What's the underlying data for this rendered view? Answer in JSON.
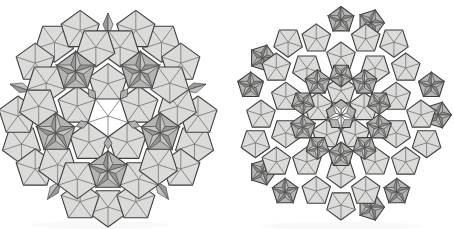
{
  "page": {
    "background": "#ffffff",
    "width": 454,
    "height": 229
  },
  "palette": {
    "pent_fill": "#dbdbd9",
    "pent_fill_alt": "#d6d6d4",
    "hole_fill": "#ffffff",
    "star_bg": "#b4b4b2",
    "star_dark": "#979795",
    "star_light": "#c6c5c3",
    "rim_star_dark": "#8d8d8b",
    "rim_star_light": "#b9b8b6",
    "white_star_dark": "#f0f0ee",
    "white_star_light": "#ffffff",
    "rhomb_fill": "#b0b0ae",
    "wedge_dark": "#9a9a98",
    "wedge_light": "#c2c1bf",
    "outline_stroke": "#3d3d3d",
    "fan_stroke": "#6b6b6b",
    "facet_stroke": "#4a4a4a",
    "outline_w": 1.1,
    "fan_w": 0.75,
    "facet_w": 0.7,
    "shadow_opacity": 0.05
  },
  "figures": [
    {
      "name": "left-patch-pentagon-hole",
      "cx": 108,
      "cy": 116,
      "pentR": 20,
      "shadow": {
        "cx": 100,
        "cy": 225,
        "rx": 70,
        "ry": 4
      },
      "pent_rings": [
        {
          "id": "caps",
          "r": 91,
          "angles": [
            270,
            342,
            54,
            126,
            198
          ],
          "orient": "D",
          "R": 20,
          "fan": true
        },
        {
          "id": "ring3",
          "r": 90,
          "angles": [
            0,
            36,
            72,
            108,
            144,
            180,
            216,
            252,
            288,
            324
          ],
          "orient": "A",
          "R": 20,
          "fan": true
        },
        {
          "id": "ring2",
          "r": 70,
          "angles": [
            8,
            28,
            80,
            100,
            152,
            172,
            224,
            244,
            296,
            316
          ],
          "orient": "D",
          "R": 20,
          "fan": true
        },
        {
          "id": "ring1",
          "r": 32.4,
          "angles": [
            90,
            162,
            234,
            306,
            18
          ],
          "orient": "A",
          "R": 20,
          "fan": true
        }
      ],
      "rhombi": [
        {
          "id": "rim-rhombi",
          "angles": [
            18,
            90,
            162,
            234,
            306
          ],
          "rIn": 80,
          "rOut": 103,
          "halfW": 5,
          "faceted": true
        },
        {
          "id": "inner-rhombi",
          "angles": [
            270,
            342,
            54,
            126,
            198
          ],
          "rIn": 21,
          "rOut": 33.5,
          "halfW": 4,
          "faceted": false
        }
      ],
      "wedges": {
        "axes": [
          270,
          342,
          54,
          126,
          198
        ],
        "offsets": [
          -13,
          13
        ],
        "apexR": 102,
        "baseR": 84,
        "baseHalfAngle": 4.5
      },
      "hole": {
        "type": "pentagon",
        "R": 21,
        "orient": "D",
        "fan": true
      },
      "stars": [
        {
          "id": "inner-stars",
          "r": 55,
          "angles": [
            270,
            342,
            54,
            126,
            198
          ],
          "Ro": 21,
          "tips": "in",
          "bg": {
            "R": 20,
            "orient": "tips"
          },
          "tone": "mid"
        }
      ]
    },
    {
      "name": "right-patch-star-hole",
      "cx": 341,
      "cy": 115,
      "pentR": 15,
      "shadow": {
        "cx": 341,
        "cy": 226,
        "rx": 80,
        "ry": 4
      },
      "rim_stars_first": [
        {
          "id": "rim-stars-a",
          "r": 95,
          "angles": [
            90,
            162,
            234,
            306,
            18
          ],
          "Ro": 14,
          "tips": "out",
          "bg": {
            "R": 13.5,
            "orient": "tips"
          },
          "tone": "dark"
        },
        {
          "id": "rim-stars-b",
          "r": 97,
          "angles": [
            0,
            72,
            144,
            216,
            288
          ],
          "Ro": 14,
          "tips": "out",
          "bg": {
            "R": 13.5,
            "orient": "tips"
          },
          "tone": "dark"
        }
      ],
      "pent_rings": [
        {
          "id": "caps",
          "r": 90,
          "angles": [
            270,
            342,
            54,
            126,
            198
          ],
          "orient": "D",
          "R": 15,
          "fan": true
        },
        {
          "id": "ring3",
          "r": 80,
          "angles": [
            0,
            36,
            72,
            108,
            144,
            180,
            216,
            252,
            288,
            324
          ],
          "orient": "A",
          "R": 15,
          "fan": true
        },
        {
          "id": "ring2",
          "r": 58,
          "angles": [
            18,
            54,
            90,
            126,
            162,
            198,
            234,
            270,
            306,
            342
          ],
          "orient": "auto",
          "R": 15,
          "fan": true
        },
        {
          "id": "ring1",
          "r": 24.3,
          "angles": [
            90,
            162,
            234,
            306,
            18
          ],
          "orient": "A",
          "R": 15,
          "fan": true
        }
      ],
      "rhombi": [],
      "wedges": null,
      "hole": {
        "type": "star",
        "bgR": 15.5,
        "bgOrient": "A",
        "Ro": 15,
        "tips": "D"
      },
      "stars": [
        {
          "id": "mid-stars-outer",
          "r": 40,
          "angles": [
            270,
            342,
            54,
            126,
            198
          ],
          "Ro": 13,
          "tips": "in",
          "bg": {
            "R": 13,
            "orient": "tips"
          },
          "tone": "mid"
        },
        {
          "id": "mid-stars-inner",
          "r": 40,
          "angles": [
            90,
            162,
            234,
            306,
            18
          ],
          "Ro": 12,
          "tips": "in",
          "bg": {
            "R": 12,
            "orient": "tips"
          },
          "tone": "mid"
        }
      ]
    }
  ]
}
